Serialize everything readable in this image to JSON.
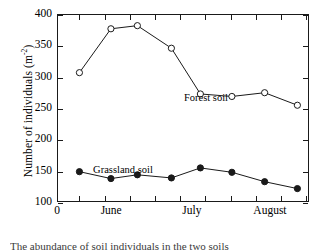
{
  "chart_data": {
    "type": "line",
    "title": "",
    "xlabel": "",
    "ylabel": "Number of individuals (m",
    "ylabel_sup": "-2",
    "ylabel_suffix": ")",
    "ylim": [
      100,
      400
    ],
    "xlim": [
      0,
      100
    ],
    "grid": false,
    "legend_position": "inline-annotation",
    "yticks": [
      400,
      350,
      300,
      250,
      200,
      150,
      100
    ],
    "ytick_labels": [
      "400",
      "350",
      "300",
      "250",
      "200",
      "150",
      "100"
    ],
    "xtick_labels": [
      "0",
      "June",
      "July",
      "August"
    ],
    "xtick_label_positions": [
      0,
      21.5,
      53.5,
      84.5
    ],
    "xticks_minor": [
      8.5,
      18.5,
      28.5,
      38.5,
      48.5,
      58.5,
      68.5,
      78.5,
      88.5,
      98.5
    ],
    "series": [
      {
        "name": "Forest soil",
        "marker": "open-circle",
        "color": "#1a1a1a",
        "x": [
          8.5,
          21.0,
          31.5,
          45.0,
          56.5,
          69.0,
          82.0,
          95.0
        ],
        "values": [
          308,
          378,
          383,
          347,
          274,
          270,
          276,
          256
        ]
      },
      {
        "name": "Grassland soil",
        "marker": "filled-circle",
        "color": "#1a1a1a",
        "x": [
          8.5,
          21.0,
          31.5,
          45.0,
          56.5,
          69.0,
          82.0,
          95.0
        ],
        "values": [
          150,
          139,
          145,
          140,
          156,
          149,
          134,
          123
        ]
      }
    ],
    "annotations": [
      {
        "text": "Forest soil",
        "x": 57,
        "y": 297
      },
      {
        "text": "Grassland soil",
        "x": 20,
        "y": 182
      }
    ]
  },
  "caption": {
    "text": "The abundance of soil individuals in the two soils"
  }
}
